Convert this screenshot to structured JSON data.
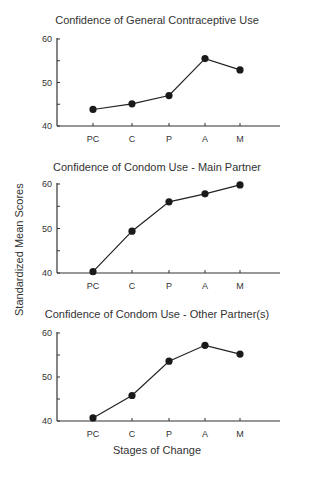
{
  "header_fragment": "",
  "ylabel": "Standardized Mean Scores",
  "xlabel": "Stages of Change",
  "chart_data": [
    {
      "type": "line",
      "title": "Confidence of General Contraceptive Use",
      "categories": [
        "PC",
        "C",
        "P",
        "A",
        "M"
      ],
      "values": [
        43.8,
        45.1,
        47.0,
        55.5,
        52.9
      ],
      "xlabel": "Stages of Change",
      "ylabel": "Standardized Mean Scores",
      "ylim": [
        40,
        60
      ],
      "yticks": [
        40,
        50,
        60
      ],
      "grid": false,
      "legend": null
    },
    {
      "type": "line",
      "title": "Confidence of Condom Use - Main Partner",
      "categories": [
        "PC",
        "C",
        "P",
        "A",
        "M"
      ],
      "values": [
        40.3,
        49.4,
        56.0,
        57.8,
        59.8
      ],
      "xlabel": "Stages of Change",
      "ylabel": "Standardized Mean Scores",
      "ylim": [
        40,
        60
      ],
      "yticks": [
        40,
        50,
        60
      ],
      "grid": false,
      "legend": null
    },
    {
      "type": "line",
      "title": "Confidence of Condom Use - Other Partner(s)",
      "categories": [
        "PC",
        "C",
        "P",
        "A",
        "M"
      ],
      "values": [
        40.7,
        45.8,
        53.6,
        57.2,
        55.2
      ],
      "xlabel": "Stages of Change",
      "ylabel": "Standardized Mean Scores",
      "ylim": [
        40,
        60
      ],
      "yticks": [
        40,
        50,
        60
      ],
      "grid": false,
      "legend": null
    }
  ]
}
